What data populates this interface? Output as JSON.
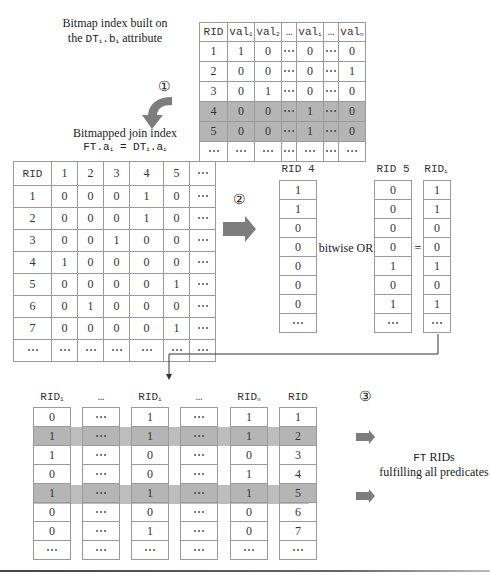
{
  "top_label": {
    "line1": "Bitmap index built on",
    "line2_prefix": "the",
    "line2_code": "DT",
    "line2_sub1": "i",
    "line2_code2": ".b",
    "line2_sub2": "i",
    "line2_suffix": "attribute"
  },
  "bitmap_index": {
    "headers": [
      "RID",
      "val",
      "val",
      "…",
      "val",
      "…",
      "val"
    ],
    "header_subs": [
      "",
      "1",
      "2",
      "",
      "i",
      "",
      "n"
    ],
    "rows": [
      [
        "1",
        "1",
        "0",
        "⋯",
        "0",
        "⋯",
        "0"
      ],
      [
        "2",
        "0",
        "0",
        "⋯",
        "0",
        "⋯",
        "1"
      ],
      [
        "3",
        "0",
        "1",
        "⋯",
        "0",
        "⋯",
        "0"
      ],
      [
        "4",
        "0",
        "0",
        "⋯",
        "1",
        "⋯",
        "0"
      ],
      [
        "5",
        "0",
        "0",
        "⋯",
        "1",
        "⋯",
        "0"
      ],
      [
        "⋯",
        "⋯",
        "⋯",
        "⋯",
        "⋯",
        "⋯",
        "⋯"
      ]
    ],
    "highlighted_rows": [
      3,
      4
    ]
  },
  "step1": {
    "marker": "①"
  },
  "join_label": {
    "line1": "Bitmapped join index",
    "lhs": "FT.a",
    "lhs_sub": "i",
    "eq": " = ",
    "rhs": "DT",
    "rhs_sub": "i",
    "rhs2": ".a",
    "rhs2_sub": "i"
  },
  "join_index": {
    "headers": [
      "RID",
      "1",
      "2",
      "3",
      "4",
      "5",
      "⋯"
    ],
    "rows": [
      [
        "1",
        "0",
        "0",
        "0",
        "1",
        "0",
        "⋯"
      ],
      [
        "2",
        "0",
        "0",
        "0",
        "1",
        "0",
        "⋯"
      ],
      [
        "3",
        "0",
        "0",
        "1",
        "0",
        "0",
        "⋯"
      ],
      [
        "4",
        "1",
        "0",
        "0",
        "0",
        "0",
        "⋯"
      ],
      [
        "5",
        "0",
        "0",
        "0",
        "0",
        "1",
        "⋯"
      ],
      [
        "6",
        "0",
        "1",
        "0",
        "0",
        "0",
        "⋯"
      ],
      [
        "7",
        "0",
        "0",
        "0",
        "0",
        "1",
        "⋯"
      ],
      [
        "⋯",
        "⋯",
        "⋯",
        "⋯",
        "⋯",
        "⋯",
        "⋯"
      ]
    ]
  },
  "step2": {
    "marker": "②",
    "operator": "bitwise OR",
    "equals": "=",
    "rid4": {
      "header": "RID 4",
      "values": [
        "1",
        "1",
        "0",
        "0",
        "0",
        "0",
        "0",
        "⋯"
      ]
    },
    "rid5": {
      "header": "RID 5",
      "values": [
        "0",
        "0",
        "0",
        "0",
        "1",
        "0",
        "1",
        "⋯"
      ]
    },
    "ridi": {
      "header": "RID",
      "sub": "i",
      "values": [
        "1",
        "1",
        "0",
        "0",
        "1",
        "0",
        "1",
        "⋯"
      ]
    }
  },
  "step3": {
    "marker": "③",
    "columns": [
      {
        "header": "RID",
        "sub": "1",
        "values": [
          "0",
          "1",
          "1",
          "0",
          "1",
          "0",
          "0",
          "⋯"
        ]
      },
      {
        "header": "…",
        "sub": "",
        "values": [
          "⋯",
          "⋯",
          "⋯",
          "⋯",
          "⋯",
          "⋯",
          "⋯",
          "⋯"
        ]
      },
      {
        "header": "RID",
        "sub": "i",
        "values": [
          "1",
          "1",
          "0",
          "0",
          "1",
          "0",
          "1",
          "⋯"
        ]
      },
      {
        "header": "…",
        "sub": "",
        "values": [
          "⋯",
          "⋯",
          "⋯",
          "⋯",
          "⋯",
          "⋯",
          "⋯",
          "⋯"
        ]
      },
      {
        "header": "RID",
        "sub": "n",
        "values": [
          "1",
          "1",
          "0",
          "1",
          "1",
          "0",
          "0",
          "⋯"
        ]
      },
      {
        "header": "RID",
        "sub": "",
        "values": [
          "1",
          "2",
          "3",
          "4",
          "5",
          "6",
          "7",
          "⋯"
        ]
      }
    ],
    "highlighted_rows": [
      1,
      4
    ],
    "result_label_code": "FT",
    "result_label_rest": " RIDs",
    "result_label_line2": "fulfilling all predicates"
  },
  "colors": {
    "highlight": "#b5b5b5",
    "arrow": "#7d7d7d",
    "grid_line": "#9a9a9a"
  }
}
